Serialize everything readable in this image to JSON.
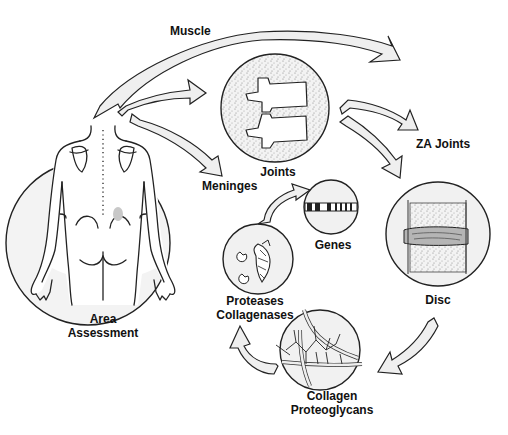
{
  "diagram": {
    "labels": {
      "muscle": "Muscle",
      "joints": "Joints",
      "za_joints": "ZA Joints",
      "meninges": "Meninges",
      "genes": "Genes",
      "disc": "Disc",
      "proteases": "Proteases",
      "collagenases": "Collagenases",
      "collagen": "Collagen",
      "proteoglycans": "Proteoglycans",
      "area": "Area",
      "assessment": "Assessment"
    },
    "nodes": [
      {
        "id": "area-assessment",
        "label": "Area Assessment",
        "icon": "human-back-figure"
      },
      {
        "id": "joints",
        "label": "Joints",
        "icon": "vertebrae"
      },
      {
        "id": "genes",
        "label": "Genes",
        "icon": "chromosome"
      },
      {
        "id": "disc",
        "label": "Disc",
        "icon": "intervertebral-disc"
      },
      {
        "id": "collagen-proteoglycans",
        "label": "Collagen Proteoglycans",
        "icon": "collagen-network"
      },
      {
        "id": "proteases-collagenases",
        "label": "Proteases Collagenases",
        "icon": "enzymes"
      }
    ],
    "edges": [
      {
        "from": "area-assessment",
        "to": "muscle"
      },
      {
        "from": "area-assessment",
        "to": "joints"
      },
      {
        "from": "area-assessment",
        "to": "meninges"
      },
      {
        "from": "joints",
        "to": "za-joints"
      },
      {
        "from": "joints",
        "to": "disc"
      },
      {
        "from": "disc",
        "to": "collagen-proteoglycans"
      },
      {
        "from": "collagen-proteoglycans",
        "to": "proteases-collagenases"
      },
      {
        "from": "proteases-collagenases",
        "to": "genes"
      }
    ]
  }
}
